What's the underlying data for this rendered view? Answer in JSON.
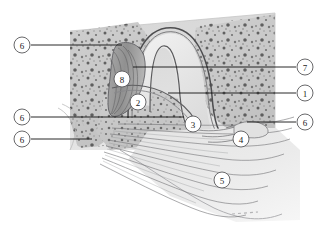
{
  "figure": {
    "type": "anatomical-illustration",
    "background_color": "#ffffff",
    "tissue_colors": {
      "pale_field": "#d9d9d9",
      "bone_matrix": "#c9c9c9",
      "bone_speckle": "#5a5a5a",
      "cartilage_band": "#8f8f8f",
      "cavity_light": "#ededed",
      "fiber_stroke": "#6e6e70",
      "outline": "#4a4a4c"
    }
  },
  "callouts": [
    {
      "id": "callout-6-a",
      "number": "6",
      "cx": 22,
      "cy": 45,
      "r": 8,
      "line": {
        "x1": 31,
        "y1": 45,
        "x2": 122,
        "y2": 45
      }
    },
    {
      "id": "callout-6-b",
      "number": "6",
      "cx": 22,
      "cy": 117,
      "r": 8,
      "line": {
        "x1": 31,
        "y1": 117,
        "x2": 184,
        "y2": 117
      }
    },
    {
      "id": "callout-6-c",
      "number": "6",
      "cx": 22,
      "cy": 139,
      "r": 8,
      "line": {
        "x1": 31,
        "y1": 139,
        "x2": 92,
        "y2": 139
      }
    },
    {
      "id": "callout-7",
      "number": "7",
      "cx": 305,
      "cy": 67,
      "r": 8,
      "line": {
        "x1": 296,
        "y1": 67,
        "x2": 133,
        "y2": 67
      }
    },
    {
      "id": "callout-1",
      "number": "1",
      "cx": 305,
      "cy": 93,
      "r": 8,
      "line": {
        "x1": 296,
        "y1": 93,
        "x2": 168,
        "y2": 93
      }
    },
    {
      "id": "callout-6-d",
      "number": "6",
      "cx": 305,
      "cy": 122,
      "r": 8,
      "line": {
        "x1": 296,
        "y1": 122,
        "x2": 247,
        "y2": 122
      }
    },
    {
      "id": "callout-8",
      "number": "8",
      "cx": 122,
      "cy": 79,
      "r": 8,
      "line": null
    },
    {
      "id": "callout-2",
      "number": "2",
      "cx": 138,
      "cy": 102,
      "r": 8,
      "line": null
    },
    {
      "id": "callout-3",
      "number": "3",
      "cx": 193,
      "cy": 124,
      "r": 8,
      "line": null
    },
    {
      "id": "callout-4",
      "number": "4",
      "cx": 241,
      "cy": 139,
      "r": 8,
      "line": null
    },
    {
      "id": "callout-5",
      "number": "5",
      "cx": 222,
      "cy": 180,
      "r": 8,
      "line": null
    }
  ]
}
